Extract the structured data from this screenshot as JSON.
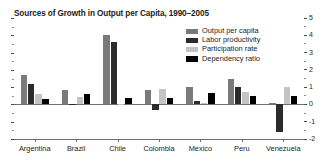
{
  "chart_data": {
    "type": "bar",
    "title": "Sources of Growth in Output per Capita, 1990–2005",
    "xlabel": "",
    "ylabel": "",
    "ylim": [
      -2,
      5
    ],
    "yticks": [
      -2,
      -1,
      0,
      1,
      2,
      3,
      4,
      5
    ],
    "ytick_labels": [
      "-2",
      "-1",
      "0",
      "1",
      "2",
      "3",
      "4",
      "5"
    ],
    "grid": false,
    "legend_position": "top-right",
    "categories": [
      "Argentina",
      "Brazil",
      "Chile",
      "Colombia",
      "Mexico",
      "Peru",
      "Venezuela"
    ],
    "series": [
      {
        "name": "Output per capita",
        "color": "#7a7a7a",
        "values": [
          1.7,
          0.85,
          4.0,
          0.85,
          1.0,
          1.5,
          0.1
        ]
      },
      {
        "name": "Labor productivity",
        "color": "#2b2b2b",
        "values": [
          1.2,
          0.05,
          3.6,
          -0.35,
          0.2,
          1.0,
          -1.6
        ]
      },
      {
        "name": "Participation rate",
        "color": "#c4c4c4",
        "values": [
          0.6,
          0.45,
          0.05,
          0.9,
          0.1,
          0.7,
          1.0
        ]
      },
      {
        "name": "Dependency ratio",
        "color": "#000000",
        "values": [
          0.3,
          0.6,
          0.35,
          0.4,
          0.65,
          0.5,
          0.5
        ]
      }
    ]
  },
  "colors": {
    "axis": "#6f6f6f",
    "text": "#1c1c1c",
    "background": "#ffffff"
  }
}
